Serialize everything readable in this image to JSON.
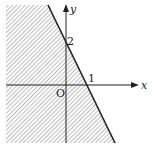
{
  "diagram": {
    "type": "inequality-region",
    "axes": {
      "x_label": "x",
      "y_label": "y",
      "origin_label": "O"
    },
    "line": {
      "x_intercept": "1",
      "y_intercept": "2"
    },
    "shaded_region": "left/below the line",
    "colors": {
      "line": "#222222",
      "hatch": "#555555",
      "background": "#ffffff"
    }
  }
}
